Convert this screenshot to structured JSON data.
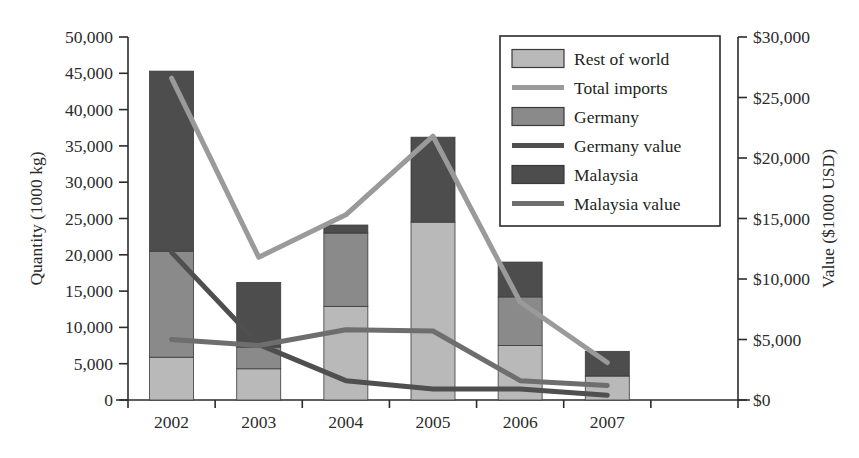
{
  "chart_data": {
    "type": "bar",
    "title": "",
    "subtitle": "",
    "xlabel": "",
    "ylabel": "Quantity (1000 kg)",
    "y2label": "Value ($1000 USD)",
    "categories": [
      "2002",
      "2003",
      "2004",
      "2005",
      "2006",
      "2007",
      ""
    ],
    "grid": false,
    "legend_position": "top-right",
    "ylim": [
      0,
      50000
    ],
    "y2lim": [
      0,
      30000
    ],
    "yticks": [
      "0",
      "5,000",
      "10,000",
      "15,000",
      "20,000",
      "25,000",
      "30,000",
      "35,000",
      "40,000",
      "45,000",
      "50,000"
    ],
    "ytick_values": [
      0,
      5000,
      10000,
      15000,
      20000,
      25000,
      30000,
      35000,
      40000,
      45000,
      50000
    ],
    "y2ticks": [
      "$0",
      "$5,000",
      "$10,000",
      "$15,000",
      "$20,000",
      "$25,000",
      "$30,000"
    ],
    "y2tick_values": [
      0,
      5000,
      10000,
      15000,
      20000,
      25000,
      30000
    ],
    "stacked": true,
    "bar_series": [
      {
        "name": "Rest of world",
        "axis": "left",
        "color": "#b9b9b9",
        "values": [
          5900,
          4300,
          12900,
          24500,
          7500,
          3300,
          null
        ]
      },
      {
        "name": "Germany",
        "axis": "left",
        "color": "#8a8a8a",
        "values": [
          14600,
          3000,
          10100,
          0,
          6700,
          0,
          null
        ]
      },
      {
        "name": "Malaysia",
        "axis": "left",
        "color": "#4d4d4d",
        "values": [
          24800,
          8900,
          1100,
          11700,
          4800,
          3400,
          null
        ]
      }
    ],
    "bar_totals": [
      45300,
      16200,
      24100,
      36200,
      19000,
      6700,
      null
    ],
    "line_series": [
      {
        "name": "Total imports",
        "axis": "right",
        "color": "#9a9a9a",
        "values": [
          26600,
          11800,
          15300,
          21800,
          8100,
          3100
        ]
      },
      {
        "name": "Germany value",
        "axis": "right",
        "color": "#4f4f4f",
        "values": [
          12200,
          4600,
          1600,
          900,
          900,
          400
        ]
      },
      {
        "name": "Malaysia value",
        "axis": "right",
        "color": "#6e6e6e",
        "values": [
          5000,
          4500,
          5800,
          5700,
          1600,
          1200
        ]
      }
    ],
    "legend": [
      {
        "label": "Rest of world",
        "marker": "box",
        "color": "#b9b9b9"
      },
      {
        "label": "Total imports",
        "marker": "line",
        "color": "#9a9a9a"
      },
      {
        "label": "Germany",
        "marker": "box",
        "color": "#8a8a8a"
      },
      {
        "label": "Germany value",
        "marker": "line",
        "color": "#4f4f4f"
      },
      {
        "label": "Malaysia",
        "marker": "box",
        "color": "#4d4d4d"
      },
      {
        "label": "Malaysia value",
        "marker": "line",
        "color": "#6e6e6e"
      }
    ]
  },
  "cropped_header_text": ""
}
